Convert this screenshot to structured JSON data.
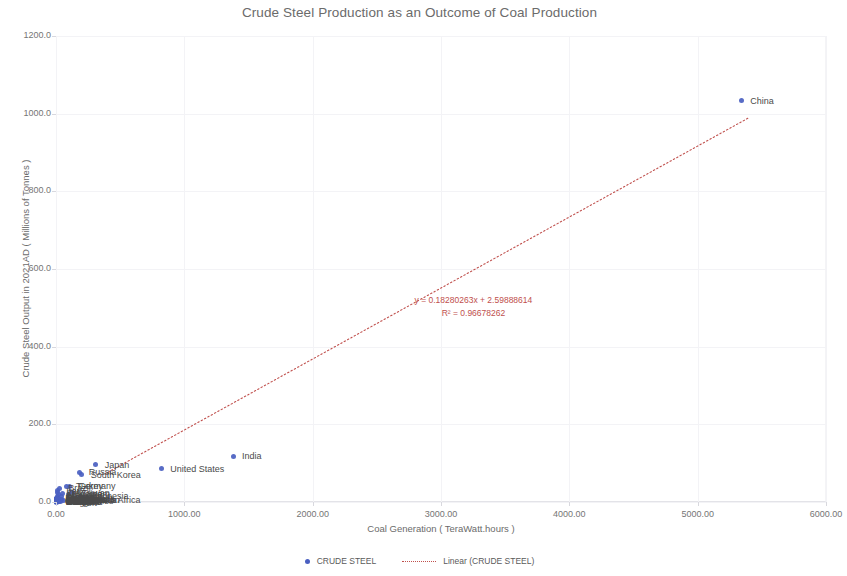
{
  "chart_data": {
    "type": "scatter",
    "title": "Crude Steel Production as an Outcome of Coal Production",
    "xlabel": "Coal Generation ( TeraWatt.hours )",
    "ylabel": "Crude Steel Output in 2021AD ( Millions of Tonnes )",
    "xlim": [
      0,
      6000
    ],
    "ylim": [
      0,
      1200
    ],
    "xticks": [
      "0.00",
      "1000.00",
      "2000.00",
      "3000.00",
      "4000.00",
      "5000.00",
      "6000.00"
    ],
    "xtick_values": [
      0,
      1000,
      2000,
      3000,
      4000,
      5000,
      6000
    ],
    "yticks": [
      "0.0",
      "200.0",
      "400.0",
      "600.0",
      "800.0",
      "1000.0",
      "1200.0"
    ],
    "ytick_values": [
      0,
      200,
      400,
      600,
      800,
      1000,
      1200
    ],
    "grid": true,
    "legend_position": "bottom",
    "series_name": "CRUDE STEEL",
    "marker_color": "#4a5fc1",
    "trendline_color": "#c0504d",
    "points": [
      {
        "label": "China",
        "x": 5340,
        "y": 1032.8
      },
      {
        "label": "India",
        "x": 1380,
        "y": 118.1
      },
      {
        "label": "Japan",
        "x": 310,
        "y": 96.3
      },
      {
        "label": "United States",
        "x": 820,
        "y": 85.8
      },
      {
        "label": "Russia",
        "x": 185,
        "y": 76.0
      },
      {
        "label": "South Korea",
        "x": 200,
        "y": 70.4
      },
      {
        "label": "Germany",
        "x": 105,
        "y": 40.1
      },
      {
        "label": "Turkey",
        "x": 85,
        "y": 40.4
      },
      {
        "label": "Brazil",
        "x": 25,
        "y": 36.0
      },
      {
        "label": "Iran",
        "x": 10,
        "y": 28.5
      },
      {
        "label": "Italy",
        "x": 14,
        "y": 24.4
      },
      {
        "label": "Taiwan",
        "x": 130,
        "y": 23.2
      },
      {
        "label": "Ukraine",
        "x": 50,
        "y": 21.4
      },
      {
        "label": "Vietnam",
        "x": 95,
        "y": 20.0
      },
      {
        "label": "Mexico",
        "x": 20,
        "y": 18.5
      },
      {
        "label": "Indonesia",
        "x": 190,
        "y": 14.3
      },
      {
        "label": "France",
        "x": 9,
        "y": 13.9
      },
      {
        "label": "Spain",
        "x": 14,
        "y": 11.2
      },
      {
        "label": "Canada",
        "x": 42,
        "y": 13.0
      },
      {
        "label": "Poland",
        "x": 118,
        "y": 8.5
      },
      {
        "label": "Austria",
        "x": 5,
        "y": 7.9
      },
      {
        "label": "Egypt",
        "x": 2,
        "y": 10.3
      },
      {
        "label": "Netherlands",
        "x": 9,
        "y": 6.6
      },
      {
        "label": "Belgium",
        "x": 4,
        "y": 6.9
      },
      {
        "label": "South Africa",
        "x": 210,
        "y": 5.0
      },
      {
        "label": "Malaysia",
        "x": 44,
        "y": 6.9
      },
      {
        "label": "Thailand",
        "x": 37,
        "y": 5.3
      },
      {
        "label": "Argentina",
        "x": 2,
        "y": 4.9
      },
      {
        "label": "Kazakhstan",
        "x": 60,
        "y": 4.2
      },
      {
        "label": "United Kingdom",
        "x": 6,
        "y": 7.2
      },
      {
        "label": "Sweden",
        "x": 1,
        "y": 4.7
      },
      {
        "label": "Finland",
        "x": 4,
        "y": 4.0
      },
      {
        "label": "Czechia",
        "x": 32,
        "y": 4.9
      },
      {
        "label": "Pakistan",
        "x": 18,
        "y": 5.2
      },
      {
        "label": "Slovakia",
        "x": 5,
        "y": 4.6
      },
      {
        "label": "Algeria",
        "x": 1,
        "y": 4.0
      },
      {
        "label": "Bangladesh",
        "x": 3,
        "y": 3.5
      },
      {
        "label": "Chile",
        "x": 12,
        "y": 1.1
      },
      {
        "label": "Philippines",
        "x": 38,
        "y": 1.5
      },
      {
        "label": "Switzerland",
        "x": 1,
        "y": 1.4
      },
      {
        "label": "Colombia",
        "x": 4,
        "y": 1.3
      },
      {
        "label": "Portugal",
        "x": 3,
        "y": 2.1
      },
      {
        "label": "Greece",
        "x": 5,
        "y": 1.4
      },
      {
        "label": "Hungary",
        "x": 2,
        "y": 1.6
      },
      {
        "label": "Peru",
        "x": 1,
        "y": 1.2
      },
      {
        "label": "Morocco",
        "x": 16,
        "y": 0.6
      },
      {
        "label": "Romania",
        "x": 6,
        "y": 3.3
      },
      {
        "label": "Serbia",
        "x": 18,
        "y": 1.5
      },
      {
        "label": "Bulgaria",
        "x": 12,
        "y": 0.6
      },
      {
        "label": "Belarus",
        "x": 1,
        "y": 2.6
      },
      {
        "label": "Australia",
        "x": 130,
        "y": 5.8
      },
      {
        "label": "Saudi Arabia",
        "x": 1,
        "y": 8.2
      },
      {
        "label": "Qatar",
        "x": 1,
        "y": 1.2
      },
      {
        "label": "Oman",
        "x": 1,
        "y": 2.0
      },
      {
        "label": "UAE",
        "x": 1,
        "y": 3.3
      },
      {
        "label": "Israel",
        "x": 6,
        "y": 0.3
      },
      {
        "label": "New Zealand",
        "x": 2,
        "y": 0.6
      },
      {
        "label": "Norway",
        "x": 1,
        "y": 0.6
      },
      {
        "label": "Denmark",
        "x": 2,
        "y": 0.0
      },
      {
        "label": "Ireland",
        "x": 1,
        "y": 0.1
      },
      {
        "label": "Luxembourg",
        "x": 1,
        "y": 2.0
      },
      {
        "label": "Croatia",
        "x": 1,
        "y": 0.1
      },
      {
        "label": "Slovenia",
        "x": 4,
        "y": 0.6
      },
      {
        "label": "Estonia",
        "x": 3,
        "y": 0.1
      },
      {
        "label": "Latvia",
        "x": 1,
        "y": 0.5
      },
      {
        "label": "Lithuania",
        "x": 1,
        "y": 0.1
      },
      {
        "label": "Tunisia",
        "x": 1,
        "y": 0.2
      },
      {
        "label": "Libya",
        "x": 1,
        "y": 0.7
      },
      {
        "label": "Kenya",
        "x": 1,
        "y": 0.1
      },
      {
        "label": "Nigeria",
        "x": 1,
        "y": 0.5
      },
      {
        "label": "Ghana",
        "x": 1,
        "y": 0.1
      },
      {
        "label": "Uruguay",
        "x": 1,
        "y": 0.1
      },
      {
        "label": "Ecuador",
        "x": 1,
        "y": 0.6
      },
      {
        "label": "Venezuela",
        "x": 1,
        "y": 0.2
      },
      {
        "label": "Cuba",
        "x": 1,
        "y": 0.3
      },
      {
        "label": "Guatemala",
        "x": 1,
        "y": 0.1
      },
      {
        "label": "Paraguay",
        "x": 1,
        "y": 0.1
      },
      {
        "label": "Myanmar",
        "x": 2,
        "y": 0.1
      },
      {
        "label": "Sri Lanka",
        "x": 3,
        "y": 0.1
      },
      {
        "label": "Nepal",
        "x": 1,
        "y": 0.1
      },
      {
        "label": "Mongolia",
        "x": 6,
        "y": 0.1
      },
      {
        "label": "Zimbabwe",
        "x": 3,
        "y": 0.1
      },
      {
        "label": "Zambia",
        "x": 1,
        "y": 0.1
      },
      {
        "label": "Mozambique",
        "x": 1,
        "y": 0.1
      },
      {
        "label": "Senegal",
        "x": 1,
        "y": 0.2
      },
      {
        "label": "Angola",
        "x": 1,
        "y": 0.1
      },
      {
        "label": "Jordan",
        "x": 1,
        "y": 0.3
      },
      {
        "label": "Lebanon",
        "x": 1,
        "y": 0.1
      },
      {
        "label": "Syria",
        "x": 1,
        "y": 0.1
      },
      {
        "label": "Iraq",
        "x": 1,
        "y": 0.6
      },
      {
        "label": "Kuwait",
        "x": 1,
        "y": 0.4
      },
      {
        "label": "Bahrain",
        "x": 1,
        "y": 0.2
      },
      {
        "label": "Azerbaijan",
        "x": 1,
        "y": 0.2
      },
      {
        "label": "Uzbekistan",
        "x": 1,
        "y": 0.8
      },
      {
        "label": "Georgia",
        "x": 1,
        "y": 0.1
      },
      {
        "label": "Moldova",
        "x": 1,
        "y": 0.4
      },
      {
        "label": "Macedonia",
        "x": 3,
        "y": 0.2
      },
      {
        "label": "Bosnia",
        "x": 5,
        "y": 0.8
      },
      {
        "label": "Albania",
        "x": 1,
        "y": 0.1
      },
      {
        "label": "Cyprus",
        "x": 1,
        "y": 0.1
      }
    ],
    "visible_point_labels": [
      {
        "label": "China",
        "x": 5340,
        "y": 1032.8,
        "dx": 9,
        "dy": 0
      },
      {
        "label": "India",
        "x": 1380,
        "y": 118.1,
        "dx": 9,
        "dy": 0
      },
      {
        "label": "Japan",
        "x": 310,
        "y": 96.3,
        "dx": 9,
        "dy": 0
      },
      {
        "label": "United States",
        "x": 820,
        "y": 85.8,
        "dx": 9,
        "dy": 0
      },
      {
        "label": "Russia",
        "x": 185,
        "y": 76.0,
        "dx": 9,
        "dy": 0
      },
      {
        "label": "South Korea",
        "x": 200,
        "y": 70.4,
        "dx": 9,
        "dy": 0
      },
      {
        "label": "Germany",
        "x": 105,
        "y": 40.1,
        "dx": 9,
        "dy": 0
      },
      {
        "label": "Turkey",
        "x": 85,
        "y": 40.4,
        "dx": 9,
        "dy": 0
      },
      {
        "label": "Brazil",
        "x": 25,
        "y": 36.0,
        "dx": 9,
        "dy": 0
      },
      {
        "label": "Iran",
        "x": 10,
        "y": 28.5,
        "dx": 9,
        "dy": 0
      },
      {
        "label": "Italy",
        "x": 14,
        "y": 24.4,
        "dx": 9,
        "dy": 0
      },
      {
        "label": "Taiwan",
        "x": 130,
        "y": 23.2,
        "dx": 9,
        "dy": 0
      },
      {
        "label": "Ukraine",
        "x": 50,
        "y": 21.4,
        "dx": 9,
        "dy": 0
      },
      {
        "label": "Vietnam",
        "x": 95,
        "y": 20.0,
        "dx": 9,
        "dy": 0
      },
      {
        "label": "Mexico",
        "x": 20,
        "y": 18.5,
        "dx": 9,
        "dy": 0
      },
      {
        "label": "Indonesia",
        "x": 190,
        "y": 14.3,
        "dx": 9,
        "dy": 0
      },
      {
        "label": "France",
        "x": 9,
        "y": 13.9,
        "dx": 9,
        "dy": 0
      },
      {
        "label": "Spain",
        "x": 14,
        "y": 11.2,
        "dx": 9,
        "dy": 0
      },
      {
        "label": "Canada",
        "x": 42,
        "y": 13.0,
        "dx": 9,
        "dy": 0
      },
      {
        "label": "Poland",
        "x": 118,
        "y": 8.5,
        "dx": 9,
        "dy": 0
      },
      {
        "label": "South Africa",
        "x": 210,
        "y": 5.0,
        "dx": 9,
        "dy": 0
      },
      {
        "label": "Malaysia",
        "x": 44,
        "y": 6.9,
        "dx": 9,
        "dy": 0
      },
      {
        "label": "Kazakhstan",
        "x": 60,
        "y": 4.2,
        "dx": 9,
        "dy": 0
      },
      {
        "label": "Australia",
        "x": 130,
        "y": 5.8,
        "dx": 9,
        "dy": 0
      },
      {
        "label": "Czechia",
        "x": 32,
        "y": 4.9,
        "dx": 9,
        "dy": 0
      },
      {
        "label": "Thailand",
        "x": 37,
        "y": 5.3,
        "dx": 9,
        "dy": 0
      },
      {
        "label": "Philippines",
        "x": 38,
        "y": 1.5,
        "dx": 9,
        "dy": 0
      },
      {
        "label": "Egypt",
        "x": 2,
        "y": 10.3,
        "dx": 9,
        "dy": 0
      },
      {
        "label": "Argentina",
        "x": 2,
        "y": 4.9,
        "dx": 9,
        "dy": 0
      },
      {
        "label": "Austria",
        "x": 5,
        "y": 7.9,
        "dx": 9,
        "dy": 0
      },
      {
        "label": "Belgium",
        "x": 4,
        "y": 6.9,
        "dx": 9,
        "dy": 0
      },
      {
        "label": "Netherlands",
        "x": 9,
        "y": 6.6,
        "dx": 9,
        "dy": 0
      },
      {
        "label": "Pakistan",
        "x": 18,
        "y": 5.2,
        "dx": 9,
        "dy": 0
      },
      {
        "label": "Sweden",
        "x": 1,
        "y": 4.7,
        "dx": 9,
        "dy": 0
      },
      {
        "label": "Finland",
        "x": 4,
        "y": 4.0,
        "dx": 9,
        "dy": 0
      },
      {
        "label": "Slovakia",
        "x": 5,
        "y": 4.6,
        "dx": 9,
        "dy": 0
      },
      {
        "label": "Romania",
        "x": 6,
        "y": 3.3,
        "dx": 9,
        "dy": 0
      },
      {
        "label": "Serbia",
        "x": 18,
        "y": 1.5,
        "dx": 9,
        "dy": 0
      },
      {
        "label": "Morocco",
        "x": 16,
        "y": 0.6,
        "dx": 9,
        "dy": 0
      },
      {
        "label": "Chile",
        "x": 12,
        "y": 1.1,
        "dx": 9,
        "dy": 0
      },
      {
        "label": "Bulgaria",
        "x": 12,
        "y": 0.6,
        "dx": 9,
        "dy": 0
      },
      {
        "label": "Portugal",
        "x": 3,
        "y": 2.1,
        "dx": 9,
        "dy": 0
      },
      {
        "label": "Greece",
        "x": 5,
        "y": 1.4,
        "dx": 9,
        "dy": 0
      },
      {
        "label": "Hungary",
        "x": 2,
        "y": 1.6,
        "dx": 9,
        "dy": 0
      },
      {
        "label": "Bosnia",
        "x": 5,
        "y": 0.8,
        "dx": 9,
        "dy": 0
      },
      {
        "label": "Mongolia",
        "x": 6,
        "y": 0.1,
        "dx": 9,
        "dy": 0
      },
      {
        "label": "Israel",
        "x": 6,
        "y": 0.3,
        "dx": 9,
        "dy": 0
      }
    ],
    "trendline": {
      "slope": 0.18280263,
      "intercept": 2.59888614,
      "equation": "y = 0.18280263x + 2.59888614",
      "r2_text": "R² = 0.96678262",
      "x_start": 380,
      "x_end": 5400
    }
  },
  "legend": {
    "items": [
      {
        "label": "CRUDE STEEL",
        "marker": "dot"
      },
      {
        "label": "Linear (CRUDE STEEL)",
        "marker": "dotted-line"
      }
    ]
  }
}
